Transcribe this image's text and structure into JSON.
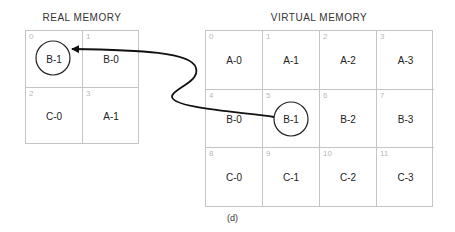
{
  "real_memory": {
    "title": "REAL MEMORY",
    "cells": [
      {
        "index": "0",
        "label": "B-1",
        "circled": true
      },
      {
        "index": "1",
        "label": "B-0",
        "circled": false
      },
      {
        "index": "2",
        "label": "C-0",
        "circled": false
      },
      {
        "index": "3",
        "label": "A-1",
        "circled": false
      }
    ]
  },
  "virtual_memory": {
    "title": "VIRTUAL MEMORY",
    "cells": [
      {
        "index": "0",
        "label": "A-0",
        "circled": false
      },
      {
        "index": "1",
        "label": "A-1",
        "circled": false
      },
      {
        "index": "2",
        "label": "A-2",
        "circled": false
      },
      {
        "index": "3",
        "label": "A-3",
        "circled": false
      },
      {
        "index": "4",
        "label": "B-0",
        "circled": false
      },
      {
        "index": "5",
        "label": "B-1",
        "circled": true
      },
      {
        "index": "6",
        "label": "B-2",
        "circled": false
      },
      {
        "index": "7",
        "label": "B-3",
        "circled": false
      },
      {
        "index": "8",
        "label": "C-0",
        "circled": false
      },
      {
        "index": "9",
        "label": "C-1",
        "circled": false
      },
      {
        "index": "10",
        "label": "C-2",
        "circled": false
      },
      {
        "index": "11",
        "label": "C-3",
        "circled": false
      }
    ]
  },
  "arrow": {
    "from": "virtual_memory.5",
    "to": "real_memory.0"
  },
  "caption": "(d)"
}
